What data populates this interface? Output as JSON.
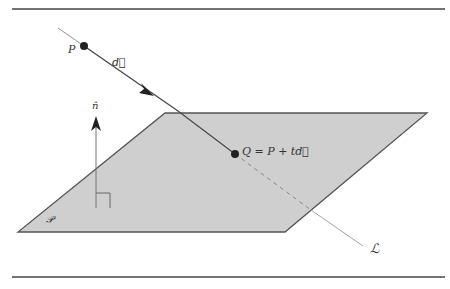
{
  "figure": {
    "labels": {
      "point_p": "P",
      "direction": "d⃗",
      "normal": "n̂",
      "intersection": "Q = P + td⃗",
      "line": "ℒ",
      "plane": "𝒫"
    },
    "colors": {
      "plane_fill": "#cfcfcf",
      "plane_edge": "#555555",
      "line": "#666666",
      "rule": "#444444",
      "point": "#222222"
    }
  }
}
